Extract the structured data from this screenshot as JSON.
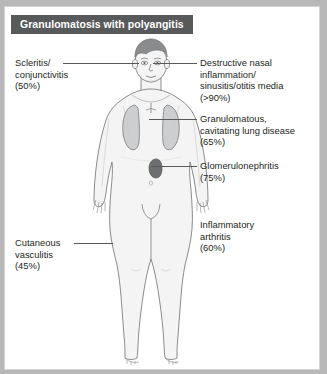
{
  "figure": {
    "title": "Granulomatosis with polyangitis",
    "background_color": "#ffffff",
    "border_color": "#d3d3d3",
    "title_bar_color": "#58595b",
    "title_text_color": "#ffffff",
    "leader_line_color": "#58595b",
    "label_text_color": "#231f20"
  },
  "anatomy": {
    "skin_fill": "#f4f4f4",
    "skin_outline": "#6d6e71",
    "hair_fill": "#8a8c8e",
    "lung_fill": "#c9cacc",
    "lung_outline": "#6d6e71",
    "kidney_fill": "#6d6e71",
    "organs": [
      {
        "name": "lungs",
        "label": "lungs"
      },
      {
        "name": "kidney",
        "label": "kidney"
      }
    ]
  },
  "labels": [
    {
      "id": "scleritis",
      "side": "left",
      "text": "Scleritis/\nconjunctivitis\n(50%)",
      "percent": "50%",
      "target": "eye"
    },
    {
      "id": "cutaneous-vasculitis",
      "side": "left",
      "text": "Cutaneous\nvasculitis\n(45%)",
      "percent": "45%",
      "target": "skin"
    },
    {
      "id": "nasal-inflammation",
      "side": "right",
      "text": "Destructive nasal\ninflammation/\nsinusitis/otitis media\n(>90%)",
      "percent": ">90%",
      "target": "nose"
    },
    {
      "id": "lung-disease",
      "side": "right",
      "text": "Granulomatous,\ncavitating lung disease\n(65%)",
      "percent": "65%",
      "target": "lung"
    },
    {
      "id": "glomerulonephritis",
      "side": "right",
      "text": "Glomerulonephritis\n(75%)",
      "percent": "75%",
      "target": "kidney"
    },
    {
      "id": "inflammatory-arthritis",
      "side": "right",
      "text": "Inflammatory\narthritis\n(60%)",
      "percent": "60%",
      "target": "joints"
    }
  ]
}
